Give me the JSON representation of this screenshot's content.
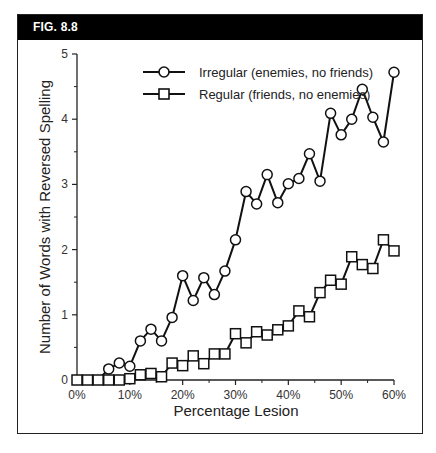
{
  "figure": {
    "label": "FIG. 8.8"
  },
  "chart_data": {
    "type": "line",
    "title": "",
    "xlabel": "Percentage Lesion",
    "ylabel": "Number of Words with Reversed Spelling",
    "xlim": [
      0,
      60
    ],
    "ylim": [
      0,
      5
    ],
    "x_tick_labels": [
      "0%",
      "10%",
      "20%",
      "30%",
      "40%",
      "50%",
      "60%"
    ],
    "y_tick_labels": [
      "0",
      "1",
      "2",
      "3",
      "4",
      "5"
    ],
    "grid": false,
    "legend_position": "upper left",
    "x": [
      0,
      2,
      4,
      6,
      8,
      10,
      12,
      14,
      16,
      18,
      20,
      22,
      24,
      26,
      28,
      30,
      32,
      34,
      36,
      38,
      40,
      42,
      44,
      46,
      48,
      50,
      52,
      54,
      56,
      58,
      60
    ],
    "series": [
      {
        "name": "Irregular (enemies, no friends)",
        "marker": "circle",
        "values": [
          0,
          0,
          0,
          0.17,
          0.26,
          0.21,
          0.6,
          0.78,
          0.6,
          0.96,
          1.6,
          1.22,
          1.57,
          1.31,
          1.67,
          2.15,
          2.89,
          2.7,
          3.15,
          2.72,
          3.01,
          3.09,
          3.47,
          3.05,
          4.09,
          3.76,
          4.0,
          4.46,
          4.03,
          3.65,
          4.72
        ]
      },
      {
        "name": "Regular (friends, no enemies)",
        "marker": "square",
        "values": [
          0,
          0,
          0,
          0,
          0,
          0.02,
          0.08,
          0.1,
          0.05,
          0.26,
          0.22,
          0.37,
          0.25,
          0.4,
          0.4,
          0.71,
          0.57,
          0.74,
          0.69,
          0.77,
          0.83,
          1.06,
          0.97,
          1.34,
          1.53,
          1.47,
          1.89,
          1.77,
          1.71,
          2.15,
          1.98
        ]
      }
    ]
  },
  "legend": {
    "items": [
      {
        "label": "Irregular (enemies, no friends)",
        "marker": "circle-icon"
      },
      {
        "label": "Regular (friends, no enemies)",
        "marker": "square-icon"
      }
    ]
  }
}
